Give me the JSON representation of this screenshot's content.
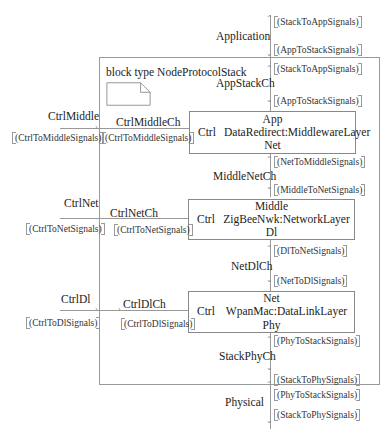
{
  "diagram": {
    "title": "block type NodeProtocolStack",
    "blocks": [
      {
        "top": "App",
        "ctrl": "Ctrl",
        "name": "DataRedirect:MiddlewareLayer",
        "bottom": "Net"
      },
      {
        "top": "Middle",
        "ctrl": "Ctrl",
        "name": "ZigBeeNwk:NetworkLayer",
        "bottom": "Dl"
      },
      {
        "top": "Net",
        "ctrl": "Ctrl",
        "name": "WpanMac:DataLinkLayer",
        "bottom": "Phy"
      }
    ],
    "gates": {
      "application": "Application",
      "physical": "Physical",
      "ctrl_middle": "CtrlMiddle",
      "ctrl_net": "CtrlNet",
      "ctrl_dl": "CtrlDl"
    },
    "channels": {
      "app_stack": "AppStackCh",
      "middle_net": "MiddleNetCh",
      "net_dl": "NetDlCh",
      "stack_phy": "StackPhyCh",
      "ctrl_middle": "CtrlMiddleCh",
      "ctrl_net": "CtrlNetCh",
      "ctrl_dl": "CtrlDlCh"
    },
    "signals": {
      "app_gate_up": "(StackToAppSignals)",
      "app_gate_down": "(AppToStackSignals)",
      "app_ch_up": "(StackToAppSignals)",
      "app_ch_down": "(AppToStackSignals)",
      "middle_net_up": "(NetToMiddleSignals)",
      "middle_net_down": "(MiddleToNetSignals)",
      "net_dl_up": "(DlToNetSignals)",
      "net_dl_down": "(NetToDlSignals)",
      "stack_phy_up": "(PhyToStackSignals)",
      "stack_phy_down": "(StackToPhySignals)",
      "phy_gate_up": "(PhyToStackSignals)",
      "phy_gate_down": "(StackToPhySignals)",
      "ctrl_middle_gate": "(CtrlToMiddleSignals)",
      "ctrl_middle_ch": "(CtrlToMiddleSignals)",
      "ctrl_net_gate": "(CtrlToNetSignals)",
      "ctrl_net_ch": "(CtrlToNetSignals)",
      "ctrl_dl_gate": "(CtrlToDlSignals)",
      "ctrl_dl_ch": "(CtrlToDlSignals)"
    }
  }
}
